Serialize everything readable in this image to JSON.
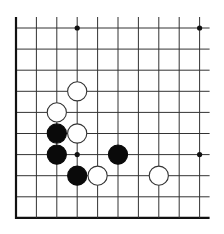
{
  "board": {
    "cols": 10,
    "rows": 10,
    "origin_x": 16,
    "origin_y": 28,
    "spacing_x": 20.4,
    "spacing_y": 21.1,
    "extend_top": 11,
    "extend_right": 10,
    "edges": {
      "left": true,
      "bottom": true,
      "top": false,
      "right": false
    },
    "line_color": "#333333",
    "edge_color": "#111111",
    "background": "#ffffff"
  },
  "star_points": [
    {
      "col": 3,
      "row": 0
    },
    {
      "col": 9,
      "row": 0
    },
    {
      "col": 3,
      "row": 6
    },
    {
      "col": 9,
      "row": 6
    }
  ],
  "stones": [
    {
      "color": "white",
      "col": 3,
      "row": 3
    },
    {
      "color": "white",
      "col": 2,
      "row": 4
    },
    {
      "color": "black",
      "col": 2,
      "row": 5
    },
    {
      "color": "white",
      "col": 3,
      "row": 5
    },
    {
      "color": "black",
      "col": 2,
      "row": 6
    },
    {
      "color": "black",
      "col": 5,
      "row": 6
    },
    {
      "color": "black",
      "col": 3,
      "row": 7
    },
    {
      "color": "white",
      "col": 4,
      "row": 7
    },
    {
      "color": "white",
      "col": 7,
      "row": 7
    }
  ],
  "colors": {
    "black_stone": "#0a0a0a",
    "white_stone_fill": "#ffffff",
    "white_stone_stroke": "#333333"
  }
}
